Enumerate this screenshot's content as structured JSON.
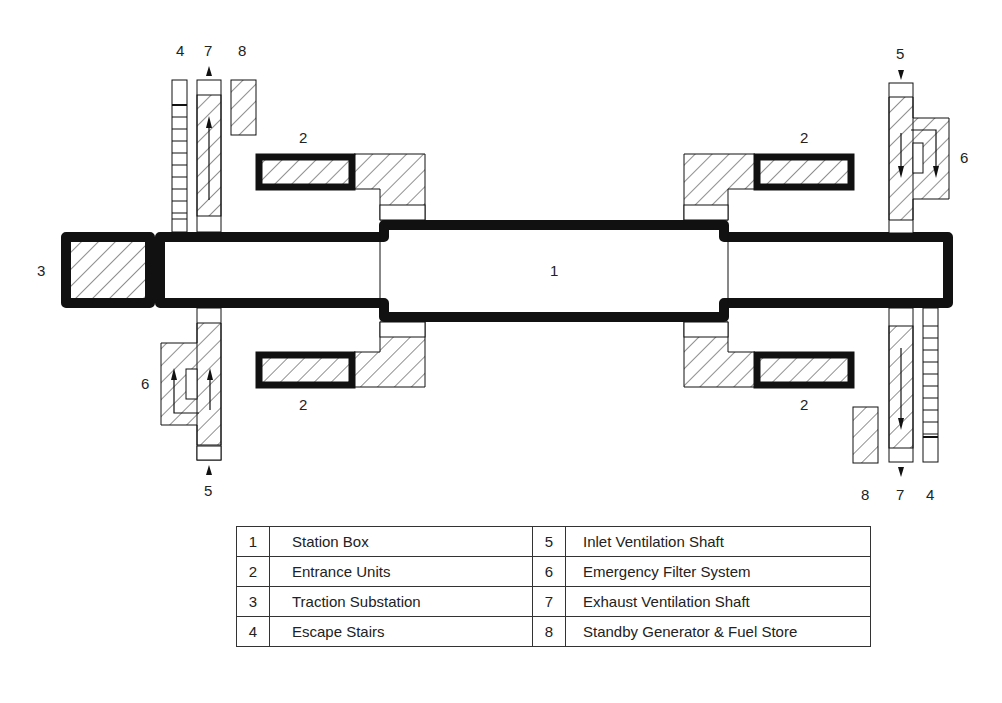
{
  "diagram": {
    "title": "",
    "labels": {
      "station_box": "1",
      "entrance_top_left": "2",
      "entrance_bottom_left": "2",
      "entrance_top_right": "2",
      "entrance_bottom_right": "2",
      "traction_substation": "3",
      "escape_stairs_left": "4",
      "escape_stairs_right": "4",
      "inlet_shaft_left": "5",
      "inlet_shaft_right": "5",
      "filter_left": "6",
      "filter_right": "6",
      "exhaust_shaft_left": "7",
      "exhaust_shaft_right": "7",
      "generator_left": "8",
      "generator_right": "8"
    },
    "colors": {
      "line": "#111111",
      "hatch": "#333333",
      "background": "#ffffff"
    }
  },
  "legend": {
    "rows": [
      {
        "num_a": "1",
        "label_a": "Station Box",
        "num_b": "5",
        "label_b": "Inlet Ventilation Shaft"
      },
      {
        "num_a": "2",
        "label_a": "Entrance Units",
        "num_b": "6",
        "label_b": "Emergency Filter System"
      },
      {
        "num_a": "3",
        "label_a": "Traction Substation",
        "num_b": "7",
        "label_b": "Exhaust Ventilation Shaft"
      },
      {
        "num_a": "4",
        "label_a": "Escape Stairs",
        "num_b": "8",
        "label_b": "Standby Generator & Fuel Store"
      }
    ]
  }
}
